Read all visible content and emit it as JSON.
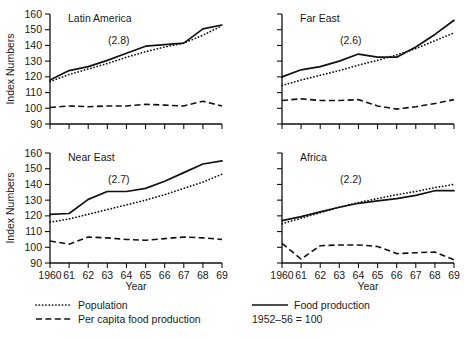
{
  "chart_data": {
    "type": "line",
    "title": "",
    "xlabel": "Year",
    "ylabel": "Index Numbers",
    "base_note": "1952–56 = 100",
    "ylim": [
      90,
      160
    ],
    "yticks": [
      90,
      100,
      110,
      120,
      130,
      140,
      150,
      160
    ],
    "ytick_labels": [
      "90",
      "100",
      "110",
      "120",
      "130",
      "140",
      "150",
      "160"
    ],
    "x": [
      1960,
      1961,
      1962,
      1963,
      1964,
      1965,
      1966,
      1967,
      1968,
      1969
    ],
    "xtick_labels": [
      "1960",
      "61",
      "62",
      "63",
      "64",
      "65",
      "66",
      "67",
      "68",
      "69"
    ],
    "grid": false,
    "legend_position": "bottom",
    "legend": [
      {
        "key": "population",
        "label": "Population",
        "style": "dotted"
      },
      {
        "key": "food_production",
        "label": "Food production",
        "style": "solid"
      },
      {
        "key": "per_capita_food_production",
        "label": "Per capita food production",
        "style": "dashed"
      }
    ],
    "panels": [
      {
        "id": "latin-america",
        "title": "Latin America",
        "rate_label": "(2.8)",
        "show_y_labels": true,
        "show_x_labels": false,
        "series": [
          {
            "name": "Food production",
            "key": "food_production",
            "style": "solid",
            "values": [
              118.0,
              124.0,
              126.5,
              130.5,
              135.0,
              139.5,
              140.5,
              141.5,
              150.5,
              153.0
            ]
          },
          {
            "name": "Population",
            "key": "population",
            "style": "dotted",
            "values": [
              117.0,
              121.5,
              125.0,
              128.5,
              132.5,
              136.0,
              139.0,
              141.5,
              146.5,
              152.5
            ]
          },
          {
            "name": "Per capita food production",
            "key": "per_capita_food_production",
            "style": "dashed",
            "values": [
              100.5,
              101.5,
              101.0,
              101.5,
              101.5,
              102.5,
              102.0,
              101.5,
              104.5,
              101.5
            ]
          }
        ]
      },
      {
        "id": "far-east",
        "title": "Far East",
        "rate_label": "(2.6)",
        "show_y_labels": false,
        "show_x_labels": false,
        "series": [
          {
            "name": "Food production",
            "key": "food_production",
            "style": "solid",
            "values": [
              120.0,
              124.5,
              126.5,
              130.0,
              134.5,
              132.5,
              132.5,
              139.0,
              147.0,
              156.0
            ]
          },
          {
            "name": "Population",
            "key": "population",
            "style": "dotted",
            "values": [
              114.5,
              118.0,
              121.0,
              124.0,
              127.5,
              130.5,
              134.0,
              138.0,
              143.0,
              148.0
            ]
          },
          {
            "name": "Per capita food production",
            "key": "per_capita_food_production",
            "style": "dashed",
            "values": [
              105.0,
              106.0,
              105.0,
              105.0,
              105.5,
              101.5,
              99.5,
              101.0,
              103.0,
              105.5
            ]
          }
        ]
      },
      {
        "id": "near-east",
        "title": "Near East",
        "rate_label": "(2.7)",
        "show_y_labels": true,
        "show_x_labels": true,
        "series": [
          {
            "name": "Food production",
            "key": "food_production",
            "style": "solid",
            "values": [
              121.0,
              121.5,
              130.5,
              135.5,
              135.5,
              137.5,
              142.0,
              147.5,
              153.0,
              155.0
            ]
          },
          {
            "name": "Population",
            "key": "population",
            "style": "dotted",
            "values": [
              116.0,
              118.0,
              121.0,
              124.0,
              127.0,
              130.0,
              133.5,
              137.5,
              141.5,
              146.5
            ]
          },
          {
            "name": "Per capita food production",
            "key": "per_capita_food_production",
            "style": "dashed",
            "values": [
              104.0,
              102.0,
              106.5,
              106.0,
              105.0,
              104.5,
              105.5,
              106.5,
              106.0,
              105.0
            ]
          }
        ]
      },
      {
        "id": "africa",
        "title": "Africa",
        "rate_label": "(2.2)",
        "show_y_labels": false,
        "show_x_labels": true,
        "series": [
          {
            "name": "Food production",
            "key": "food_production",
            "style": "solid",
            "values": [
              117.0,
              119.5,
              122.5,
              125.5,
              128.0,
              129.5,
              131.0,
              133.0,
              136.0,
              136.0
            ]
          },
          {
            "name": "Population",
            "key": "population",
            "style": "dotted",
            "values": [
              115.0,
              118.5,
              122.0,
              125.5,
              128.5,
              131.0,
              133.5,
              135.5,
              138.0,
              140.0
            ]
          },
          {
            "name": "Per capita food production",
            "key": "per_capita_food_production",
            "style": "dashed",
            "values": [
              102.5,
              92.5,
              101.0,
              101.5,
              101.5,
              100.5,
              96.0,
              96.5,
              97.0,
              92.0
            ]
          }
        ]
      }
    ]
  }
}
